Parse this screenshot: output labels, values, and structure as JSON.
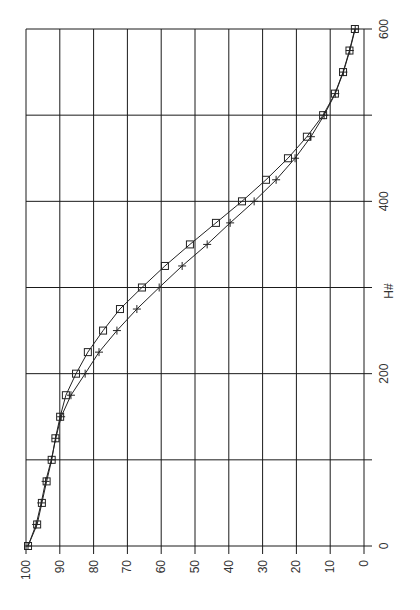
{
  "chart_data": {
    "type": "line",
    "orientation": "rotated-90-ccw",
    "title": "",
    "xlabel": "H#",
    "ylabel": "",
    "xlim": [
      0,
      600
    ],
    "ylim": [
      0,
      100
    ],
    "x_ticks": [
      "0",
      "200",
      "400",
      "600"
    ],
    "y_ticks": [
      "100",
      "90",
      "80",
      "70",
      "60",
      "50",
      "40",
      "30",
      "20",
      "10",
      "0"
    ],
    "grid": true,
    "legend": null,
    "x": [
      0,
      25,
      50,
      75,
      100,
      125,
      150,
      175,
      200,
      225,
      250,
      275,
      300,
      325,
      350,
      375,
      400,
      425,
      450,
      475,
      500,
      525,
      550,
      575,
      600
    ],
    "series": [
      {
        "name": "square-marker series",
        "marker": "square",
        "values": [
          99.4,
          96.7,
          95.3,
          93.9,
          92.4,
          91.3,
          89.9,
          88.2,
          85.2,
          81.7,
          77.2,
          72.2,
          65.7,
          58.9,
          51.5,
          43.8,
          36.1,
          29.0,
          22.5,
          16.9,
          12.1,
          8.6,
          6.2,
          4.3,
          2.7
        ]
      },
      {
        "name": "plus-marker series",
        "marker": "plus",
        "values": [
          99.4,
          97.0,
          95.5,
          94.2,
          92.5,
          91.2,
          89.6,
          86.7,
          82.5,
          78.4,
          73.1,
          67.2,
          60.6,
          53.8,
          46.4,
          39.6,
          32.5,
          26.0,
          20.4,
          15.7,
          11.8,
          8.5,
          6.1,
          4.2,
          2.6
        ]
      }
    ]
  },
  "axis": {
    "x_label": "H#",
    "x_tick_labels": [
      "0",
      "200",
      "400",
      "600"
    ],
    "y_tick_labels": [
      "100",
      "90",
      "80",
      "70",
      "60",
      "50",
      "40",
      "30",
      "20",
      "10",
      "0"
    ]
  }
}
